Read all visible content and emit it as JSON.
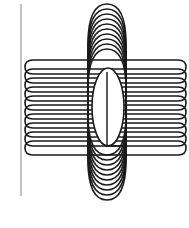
{
  "figure": {
    "colors": {
      "stroke": "#1a1a1a",
      "axis": "#888888",
      "background": "#ffffff"
    },
    "axis_line": {
      "x": 21,
      "y1": 4,
      "y2": 196
    },
    "horizontal_coils": {
      "count": 10,
      "x_left": 25,
      "x_right": 186,
      "y_top": 60,
      "y_step": 9,
      "ry": 14
    },
    "vertical_coils": {
      "count": 10,
      "x_left": 88,
      "x_right": 126,
      "y_top": 4,
      "y_bottom": 200,
      "step": 5
    },
    "center_ellipse": {
      "cx": 108,
      "cy": 107,
      "rx": 16,
      "ry": 39
    },
    "inner_line": {
      "x": 107,
      "y1": 72,
      "y2": 146,
      "x_end": 120
    }
  }
}
